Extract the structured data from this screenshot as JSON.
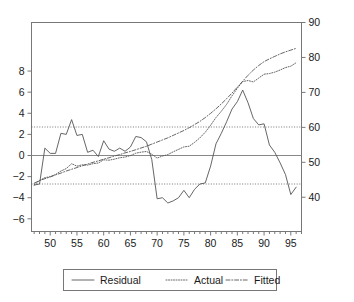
{
  "chart_data": {
    "type": "line",
    "title": "",
    "subtitle": "",
    "xlabel": "",
    "ylabel": "",
    "y2label": "",
    "xlim": [
      46.5,
      97
    ],
    "ylim": [
      -7.2,
      12.6
    ],
    "y2lim": [
      30.2,
      90.0
    ],
    "grid": false,
    "legend_position": "bottom",
    "x_ticks": [
      50,
      55,
      60,
      65,
      70,
      75,
      80,
      85,
      90,
      95
    ],
    "x_minor_tick_step": 1,
    "y_ticks": [
      8,
      6,
      4,
      2,
      0,
      -2,
      -4,
      -6
    ],
    "y2_ticks": [
      90,
      80,
      70,
      60,
      50,
      40
    ],
    "reference_lines": [
      2.7,
      -2.7
    ],
    "zero_line": 0,
    "x": [
      47,
      48,
      49,
      50,
      51,
      52,
      53,
      54,
      55,
      56,
      57,
      58,
      59,
      60,
      61,
      62,
      63,
      64,
      65,
      66,
      67,
      68,
      69,
      70,
      71,
      72,
      73,
      74,
      75,
      76,
      77,
      78,
      79,
      80,
      81,
      82,
      83,
      84,
      85,
      86,
      87,
      88,
      89,
      90,
      91,
      92,
      93,
      94,
      95,
      96
    ],
    "series": [
      {
        "name": "Residual",
        "axis": "left",
        "style": "solid",
        "values": [
          -2.8,
          -2.7,
          0.7,
          0.2,
          0.2,
          2.1,
          2.0,
          3.4,
          1.9,
          2.0,
          0.3,
          0.5,
          -0.1,
          1.4,
          0.6,
          0.4,
          0.7,
          0.4,
          0.8,
          1.8,
          1.7,
          1.3,
          -0.4,
          -4.1,
          -4.0,
          -4.5,
          -4.3,
          -4.0,
          -3.3,
          -4.0,
          -3.2,
          -2.7,
          -2.6,
          -1.0,
          1.1,
          2.1,
          3.2,
          4.4,
          5.1,
          6.2,
          5.0,
          3.5,
          2.9,
          3.0,
          1.0,
          0.3,
          -0.7,
          -1.8,
          -3.7,
          -3.0
        ]
      },
      {
        "name": "Actual",
        "axis": "right",
        "style": "dotted",
        "values": [
          43.5,
          44.8,
          45.6,
          45.9,
          46.5,
          47.5,
          48.2,
          49.6,
          48.9,
          49.3,
          49.2,
          49.6,
          49.8,
          50.7,
          50.6,
          50.9,
          51.3,
          51.5,
          51.9,
          52.6,
          52.9,
          53.1,
          52.3,
          51.2,
          51.8,
          52.2,
          53.0,
          53.7,
          54.4,
          54.6,
          55.7,
          57.0,
          58.6,
          60.6,
          62.8,
          64.6,
          66.6,
          69.0,
          71.2,
          73.1,
          73.4,
          73.0,
          74.1,
          75.2,
          75.4,
          75.8,
          76.4,
          77.1,
          77.5,
          78.5
        ]
      },
      {
        "name": "Fitted",
        "axis": "right",
        "style": "dashdot",
        "values": [
          44.0,
          44.8,
          45.3,
          45.8,
          46.4,
          46.9,
          47.5,
          48.0,
          48.5,
          49.0,
          49.5,
          50.0,
          50.4,
          50.9,
          51.3,
          51.8,
          52.2,
          52.7,
          53.1,
          53.6,
          54.1,
          54.6,
          55.2,
          55.8,
          56.4,
          57.0,
          57.7,
          58.4,
          59.1,
          59.9,
          60.8,
          61.7,
          62.8,
          64.0,
          65.3,
          66.7,
          68.2,
          69.8,
          71.5,
          73.2,
          74.9,
          76.4,
          77.7,
          78.8,
          79.6,
          80.3,
          81.0,
          81.6,
          82.1,
          82.6
        ]
      }
    ],
    "legend": [
      {
        "label": "Residual",
        "style": "solid"
      },
      {
        "label": "Actual",
        "style": "dotted"
      },
      {
        "label": "Fitted",
        "style": "dashdot"
      }
    ],
    "colors": {
      "residual": "#555555",
      "actual": "#555555",
      "fitted": "#555555",
      "frame": "#777777",
      "background": "#ffffff"
    }
  }
}
